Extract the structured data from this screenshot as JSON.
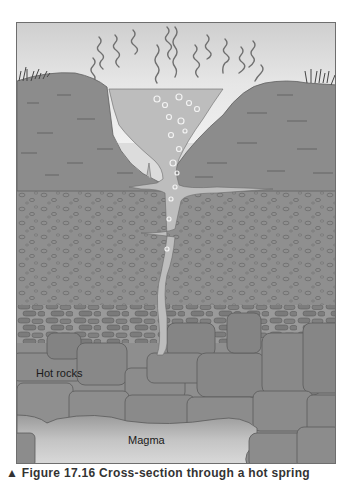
{
  "figure": {
    "labels": {
      "hot_rocks": "Hot rocks",
      "magma": "Magma"
    },
    "layers": [
      {
        "name": "sky",
        "color": "#e4e4e4"
      },
      {
        "name": "surface-hills",
        "color": "#8c8c8c"
      },
      {
        "name": "hot-spring-pool",
        "color": "#bdbdbd"
      },
      {
        "name": "gravel-layer",
        "color": "#8f8f8f"
      },
      {
        "name": "cobble-layer",
        "color": "#8a8a8a"
      },
      {
        "name": "hot-rocks",
        "color": "#8e8e8e"
      },
      {
        "name": "magma",
        "color": "#c8c8c8"
      }
    ],
    "elements": [
      "steam-wisps",
      "grass-tufts",
      "bubbles",
      "water-conduit",
      "side-fissures"
    ]
  },
  "caption": {
    "text": "▲ Figure 17.16  Cross-section through a hot spring"
  }
}
